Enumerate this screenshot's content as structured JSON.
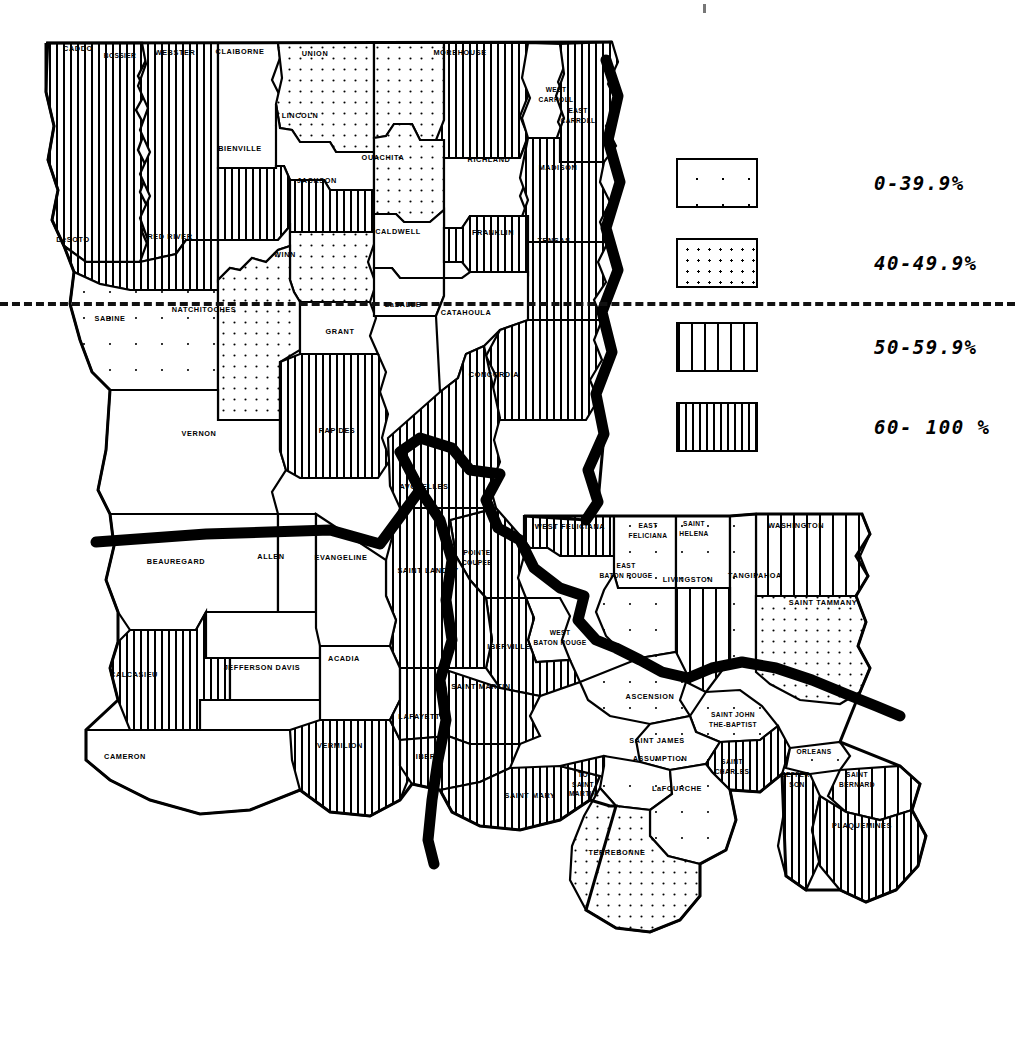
{
  "map": {
    "title": "Louisiana Parish Map",
    "state": "Louisiana",
    "unit": "parish",
    "outline_color": "#000000",
    "background_color": "#ffffff"
  },
  "legend": {
    "name": "percentage-legend",
    "divider": "dashed-separator-line",
    "items": [
      {
        "label": "0-39.9%",
        "pattern": "sparse-dots",
        "range": [
          0,
          39.9
        ]
      },
      {
        "label": "40-49.9%",
        "pattern": "dense-dots",
        "range": [
          40,
          49.9
        ]
      },
      {
        "label": "50-59.9%",
        "pattern": "wide-stripes",
        "range": [
          50,
          59.9
        ]
      },
      {
        "label": "60- 100 %",
        "pattern": "dense-stripes",
        "range": [
          60,
          100
        ]
      }
    ]
  },
  "chart_data": {
    "type": "map",
    "classes": [
      "0-39.9%",
      "40-49.9%",
      "50-59.9%",
      "60- 100 %"
    ],
    "regions": [
      {
        "name": "CADDO",
        "class": "60- 100 %"
      },
      {
        "name": "BOSSIER",
        "class": "60- 100 %"
      },
      {
        "name": "WEBSTER",
        "class": "0-39.9%"
      },
      {
        "name": "CLAIBORNE",
        "class": "40-49.9%"
      },
      {
        "name": "UNION",
        "class": "40-49.9%"
      },
      {
        "name": "MOREHOUSE",
        "class": "60- 100 %"
      },
      {
        "name": "WEST CARROLL",
        "class": "0-39.9%"
      },
      {
        "name": "EAST CARROLL",
        "class": "60- 100 %"
      },
      {
        "name": "LINCOLN",
        "class": "0-39.9%"
      },
      {
        "name": "BIENVILLE",
        "class": "60- 100 %"
      },
      {
        "name": "JACKSON",
        "class": "60- 100 %"
      },
      {
        "name": "OUACHITA",
        "class": "40-49.9%"
      },
      {
        "name": "RICHLAND",
        "class": "0-39.9%"
      },
      {
        "name": "MADISON",
        "class": "60- 100 %"
      },
      {
        "name": "DeSOTO",
        "class": "60- 100 %"
      },
      {
        "name": "RED RIVER",
        "class": "0-39.9%"
      },
      {
        "name": "WINN",
        "class": "40-49.9%"
      },
      {
        "name": "CALDWELL",
        "class": "0-39.9%"
      },
      {
        "name": "FRANKLIN",
        "class": "60- 100 %"
      },
      {
        "name": "TENSAS",
        "class": "60- 100 %"
      },
      {
        "name": "SABINE",
        "class": "0-39.9%"
      },
      {
        "name": "NATCHITOCHES",
        "class": "40-49.9%"
      },
      {
        "name": "GRANT",
        "class": "0-39.9%"
      },
      {
        "name": "LaSALLE",
        "class": "0-39.9%"
      },
      {
        "name": "CATAHOULA",
        "class": "0-39.9%"
      },
      {
        "name": "CONCORDIA",
        "class": "60- 100 %"
      },
      {
        "name": "VERNON",
        "class": "0-39.9%"
      },
      {
        "name": "RAPIDES",
        "class": "60- 100 %"
      },
      {
        "name": "AVOYELLES",
        "class": "60- 100 %"
      },
      {
        "name": "WEST FELICIANA",
        "class": "60- 100 %"
      },
      {
        "name": "EAST FELICIANA",
        "class": "0-39.9%"
      },
      {
        "name": "SAINT HELENA",
        "class": "0-39.9%"
      },
      {
        "name": "WASHINGTON",
        "class": "50-59.9%"
      },
      {
        "name": "BEAUREGARD",
        "class": "0-39.9%"
      },
      {
        "name": "ALLEN",
        "class": "0-39.9%"
      },
      {
        "name": "EVANGELINE",
        "class": "0-39.9%"
      },
      {
        "name": "SAINT LANDRY",
        "class": "60- 100 %"
      },
      {
        "name": "POINTE COUPEE",
        "class": "60- 100 %"
      },
      {
        "name": "EAST BATON ROUGE",
        "class": "0-39.9%"
      },
      {
        "name": "LIVINGSTON",
        "class": "50-59.9%"
      },
      {
        "name": "TANGIPAHOA",
        "class": "0-39.9%"
      },
      {
        "name": "SAINT TAMMANY",
        "class": "40-49.9%"
      },
      {
        "name": "CALCASIEU",
        "class": "60- 100 %"
      },
      {
        "name": "JEFFERSON DAVIS",
        "class": "0-39.9%"
      },
      {
        "name": "ACADIA",
        "class": "0-39.9%"
      },
      {
        "name": "IBERVILLE",
        "class": "60- 100 %"
      },
      {
        "name": "WEST BATON ROUGE",
        "class": "0-39.9%"
      },
      {
        "name": "SAINT MARTIN",
        "class": "60- 100 %"
      },
      {
        "name": "LAFAYETTE",
        "class": "60- 100 %"
      },
      {
        "name": "ASCENSION",
        "class": "0-39.9%"
      },
      {
        "name": "SAINT JOHN THE BAPTIST",
        "class": "0-39.9%"
      },
      {
        "name": "CAMERON",
        "class": "0-39.9%"
      },
      {
        "name": "VERMILION",
        "class": "60- 100 %"
      },
      {
        "name": "IBERIA",
        "class": "60- 100 %"
      },
      {
        "name": "SAINT JAMES",
        "class": "0-39.9%"
      },
      {
        "name": "ASSUMPTION",
        "class": "0-39.9%"
      },
      {
        "name": "SAINT CHARLES",
        "class": "60- 100 %"
      },
      {
        "name": "ORLEANS",
        "class": "0-39.9%"
      },
      {
        "name": "JEFFERSON",
        "class": "60- 100 %"
      },
      {
        "name": "SAINT BERNARD",
        "class": "50-59.9%"
      },
      {
        "name": "SAINT MARY",
        "class": "60- 100 %"
      },
      {
        "name": "TO SAINT MARTIN",
        "class": "60- 100 %"
      },
      {
        "name": "LaFOURCHE",
        "class": "0-39.9%"
      },
      {
        "name": "PLAQUEMINES",
        "class": "60- 100 %"
      },
      {
        "name": "TERREBONNE",
        "class": "40-49.9%"
      }
    ]
  },
  "labels": [
    {
      "text": "CADDO",
      "x": 78,
      "y": 49,
      "size": "sm"
    },
    {
      "text": "BOSSIER",
      "x": 120,
      "y": 56,
      "size": "xs"
    },
    {
      "text": "WEBSTER",
      "x": 175,
      "y": 53,
      "size": "sm"
    },
    {
      "text": "CLAIBORNE",
      "x": 240,
      "y": 52,
      "size": "sm"
    },
    {
      "text": "UNION",
      "x": 315,
      "y": 54,
      "size": "sm"
    },
    {
      "text": "MOREHOUSE",
      "x": 460,
      "y": 53,
      "size": "sm"
    },
    {
      "text": "WEST\nCARROLL",
      "x": 556,
      "y": 94,
      "size": "xs"
    },
    {
      "text": "EAST\nCARROLL",
      "x": 578,
      "y": 115,
      "size": "xs"
    },
    {
      "text": "LINCOLN",
      "x": 300,
      "y": 116,
      "size": "sm"
    },
    {
      "text": "BIENVILLE",
      "x": 240,
      "y": 149,
      "size": "sm"
    },
    {
      "text": "JACKSON",
      "x": 317,
      "y": 181,
      "size": "sm"
    },
    {
      "text": "OUACHITA",
      "x": 383,
      "y": 158,
      "size": "sm"
    },
    {
      "text": "RICHLAND",
      "x": 489,
      "y": 160,
      "size": "sm"
    },
    {
      "text": "MADISON",
      "x": 558,
      "y": 168,
      "size": "sm"
    },
    {
      "text": "DeSOTO",
      "x": 73,
      "y": 240,
      "size": "sm"
    },
    {
      "text": "RED RIVER",
      "x": 170,
      "y": 237,
      "size": "sm"
    },
    {
      "text": "WINN",
      "x": 285,
      "y": 255,
      "size": "sm"
    },
    {
      "text": "CALDWELL",
      "x": 398,
      "y": 232,
      "size": "sm"
    },
    {
      "text": "FRANKLIN",
      "x": 493,
      "y": 233,
      "size": "sm"
    },
    {
      "text": "TENSAS",
      "x": 554,
      "y": 241,
      "size": "sm"
    },
    {
      "text": "SABINE",
      "x": 110,
      "y": 319,
      "size": "sm"
    },
    {
      "text": "NATCHITOCHES",
      "x": 204,
      "y": 310,
      "size": "sm"
    },
    {
      "text": "GRANT",
      "x": 340,
      "y": 332,
      "size": "sm"
    },
    {
      "text": "LaSALLE",
      "x": 403,
      "y": 305,
      "size": "sm"
    },
    {
      "text": "CATAHOULA",
      "x": 466,
      "y": 313,
      "size": "sm"
    },
    {
      "text": "CONCORDIA",
      "x": 494,
      "y": 375,
      "size": "sm"
    },
    {
      "text": "VERNON",
      "x": 199,
      "y": 434,
      "size": "sm"
    },
    {
      "text": "RAPIDES",
      "x": 337,
      "y": 431,
      "size": "sm"
    },
    {
      "text": "AVOYELLES",
      "x": 424,
      "y": 487,
      "size": "sm"
    },
    {
      "text": "WEST FELICIANA",
      "x": 570,
      "y": 527,
      "size": "sm"
    },
    {
      "text": "EAST\nFELICIANA",
      "x": 648,
      "y": 530,
      "size": "xs"
    },
    {
      "text": "SAINT\nHELENA",
      "x": 694,
      "y": 528,
      "size": "xs"
    },
    {
      "text": "WASHINGTON",
      "x": 796,
      "y": 526,
      "size": "sm"
    },
    {
      "text": "BEAUREGARD",
      "x": 176,
      "y": 562,
      "size": "sm"
    },
    {
      "text": "ALLEN",
      "x": 271,
      "y": 557,
      "size": "sm"
    },
    {
      "text": "EVANGELINE",
      "x": 341,
      "y": 558,
      "size": "sm"
    },
    {
      "text": "SAINT LANDRY",
      "x": 428,
      "y": 571,
      "size": "sm"
    },
    {
      "text": "POINTE\nCOUPEE",
      "x": 477,
      "y": 557,
      "size": "xs"
    },
    {
      "text": "EAST\nBATON ROUGE",
      "x": 626,
      "y": 570,
      "size": "xs"
    },
    {
      "text": "LIVINGSTON",
      "x": 688,
      "y": 580,
      "size": "sm"
    },
    {
      "text": "TANGIPAHOA",
      "x": 755,
      "y": 576,
      "size": "sm"
    },
    {
      "text": "SAINT TAMMANY",
      "x": 823,
      "y": 603,
      "size": "sm"
    },
    {
      "text": "CALCASIEU",
      "x": 134,
      "y": 675,
      "size": "sm"
    },
    {
      "text": "JEFFERSON DAVIS",
      "x": 262,
      "y": 668,
      "size": "sm"
    },
    {
      "text": "ACADIA",
      "x": 344,
      "y": 659,
      "size": "sm"
    },
    {
      "text": "IBERVILLE",
      "x": 509,
      "y": 647,
      "size": "sm"
    },
    {
      "text": "WEST\nBATON ROUGE",
      "x": 560,
      "y": 637,
      "size": "xs"
    },
    {
      "text": "SAINT MARTIN",
      "x": 481,
      "y": 687,
      "size": "sm"
    },
    {
      "text": "LAFAYETTE",
      "x": 422,
      "y": 717,
      "size": "sm"
    },
    {
      "text": "ASCENSION",
      "x": 650,
      "y": 697,
      "size": "sm"
    },
    {
      "text": "SAINT JOHN\nTHE-BAPTIST",
      "x": 733,
      "y": 719,
      "size": "xs"
    },
    {
      "text": "CAMERON",
      "x": 125,
      "y": 757,
      "size": "sm"
    },
    {
      "text": "VERMILION",
      "x": 340,
      "y": 746,
      "size": "sm"
    },
    {
      "text": "IBERIA",
      "x": 430,
      "y": 757,
      "size": "sm"
    },
    {
      "text": "SAINT JAMES",
      "x": 657,
      "y": 741,
      "size": "sm"
    },
    {
      "text": "ASSUMPTION",
      "x": 660,
      "y": 759,
      "size": "sm"
    },
    {
      "text": "SAINT\nCHARLES",
      "x": 732,
      "y": 766,
      "size": "xs"
    },
    {
      "text": "ORLEANS",
      "x": 814,
      "y": 752,
      "size": "xs"
    },
    {
      "text": "JEFFER-\nSON",
      "x": 797,
      "y": 779,
      "size": "xs"
    },
    {
      "text": "SAINT\nBERNARD",
      "x": 857,
      "y": 779,
      "size": "xs"
    },
    {
      "text": "SAINT MARY",
      "x": 530,
      "y": 796,
      "size": "sm"
    },
    {
      "text": "TO\nSAINT\nMARTIN",
      "x": 583,
      "y": 784,
      "size": "xs"
    },
    {
      "text": "LaFOURCHE",
      "x": 677,
      "y": 789,
      "size": "sm"
    },
    {
      "text": "PLAQUEMINES",
      "x": 862,
      "y": 826,
      "size": "sm"
    },
    {
      "text": "TERREBONNE",
      "x": 617,
      "y": 853,
      "size": "sm"
    }
  ]
}
